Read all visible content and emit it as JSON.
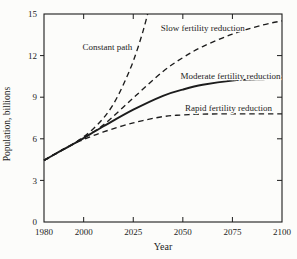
{
  "figure": {
    "background": "#fcfcfa",
    "ink": "#1c1c1c"
  },
  "chart_data": {
    "type": "line",
    "title": "",
    "xlabel": "Year",
    "ylabel": "Population, billions",
    "xlim": [
      1980,
      2100
    ],
    "ylim": [
      0,
      15
    ],
    "x_ticks": [
      1980,
      2000,
      2025,
      2050,
      2075,
      2100
    ],
    "y_ticks": [
      0,
      3,
      6,
      9,
      12,
      15
    ],
    "grid": false,
    "legend_position": "inline-annotations",
    "series": [
      {
        "name": "Constant path",
        "style": "dashed",
        "x": [
          1980,
          1985,
          1990,
          1995,
          2000,
          2005,
          2010,
          2015,
          2020,
          2025,
          2030,
          2034
        ],
        "values": [
          4.45,
          4.85,
          5.25,
          5.65,
          6.15,
          6.75,
          7.5,
          8.5,
          9.9,
          11.6,
          13.8,
          16.0
        ]
      },
      {
        "name": "Slow fertility reduction",
        "style": "dashed",
        "x": [
          1980,
          1985,
          1990,
          1995,
          2000,
          2010,
          2025,
          2040,
          2050,
          2060,
          2075,
          2090,
          2100
        ],
        "values": [
          4.45,
          4.85,
          5.25,
          5.65,
          6.1,
          7.0,
          8.95,
          10.85,
          11.85,
          12.65,
          13.55,
          14.2,
          14.5
        ]
      },
      {
        "name": "Moderate fertility reduction",
        "style": "solid",
        "x": [
          1980,
          1985,
          1990,
          1995,
          2000,
          2010,
          2025,
          2040,
          2050,
          2060,
          2075,
          2090,
          2100
        ],
        "values": [
          4.45,
          4.85,
          5.25,
          5.65,
          6.05,
          6.9,
          8.1,
          9.1,
          9.55,
          9.9,
          10.2,
          10.3,
          10.35
        ]
      },
      {
        "name": "Rapid fertility reduction",
        "style": "dashed",
        "x": [
          1980,
          1985,
          1990,
          1995,
          2000,
          2010,
          2025,
          2040,
          2050,
          2060,
          2075,
          2090,
          2100
        ],
        "values": [
          4.45,
          4.85,
          5.25,
          5.65,
          5.95,
          6.5,
          7.15,
          7.6,
          7.72,
          7.78,
          7.8,
          7.8,
          7.8
        ]
      }
    ],
    "annotations": [
      {
        "text": "Constant path",
        "year": 2012,
        "value": 12.6
      },
      {
        "text": "Slow fertility reduction",
        "year": 2060,
        "value": 14.0
      },
      {
        "text": "Moderate fertility reduction",
        "year": 2074,
        "value": 10.55
      },
      {
        "text": "Rapid fertility reduction",
        "year": 2073,
        "value": 8.2
      }
    ]
  }
}
